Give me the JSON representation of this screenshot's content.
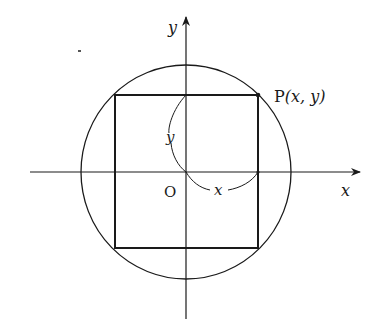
{
  "diagram": {
    "title": "",
    "axes": {
      "x_label": "x",
      "y_label": "y",
      "origin_label": "O"
    },
    "point": {
      "label": "P(x, y)",
      "name": "P",
      "coords": "(x, y)"
    },
    "dimensions": {
      "width_label": "x",
      "height_label": "y"
    },
    "shapes": [
      "circle centered at origin",
      "rectangle inscribed in circle with corner P"
    ],
    "colors": {
      "stroke": "#1a1a1a",
      "background": "#ffffff"
    }
  }
}
